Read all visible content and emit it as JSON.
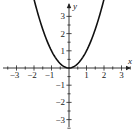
{
  "chart_data": {
    "type": "line",
    "title": "",
    "xlabel": "x",
    "ylabel": "y",
    "xlim": [
      -3.5,
      3.5
    ],
    "ylim": [
      -3.5,
      3.5
    ],
    "grid": false,
    "x_ticks": [
      -3,
      -2,
      -1,
      1,
      2,
      3
    ],
    "y_ticks": [
      -3,
      -2,
      -1,
      1,
      2,
      3
    ],
    "minor_tick_step": 0.5,
    "series": [
      {
        "name": "y = x^2",
        "function": "x^2",
        "x_range": [
          -2.62,
          2.62
        ],
        "color": "#111111"
      }
    ]
  }
}
